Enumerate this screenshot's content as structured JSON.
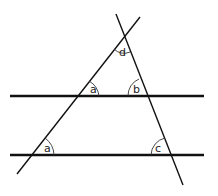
{
  "diagram": {
    "stroke_color": "#111111",
    "parallel_lines": [
      {
        "name": "upper-parallel-line",
        "x1": 10,
        "y1": 96,
        "x2": 204,
        "y2": 96
      },
      {
        "name": "lower-parallel-line",
        "x1": 10,
        "y1": 155,
        "x2": 204,
        "y2": 155
      }
    ],
    "transversals": [
      {
        "name": "left-transversal",
        "x1": 17,
        "y1": 174,
        "x2": 140,
        "y2": 17
      },
      {
        "name": "right-transversal",
        "x1": 116,
        "y1": 14,
        "x2": 183,
        "y2": 185
      }
    ],
    "angles": [
      {
        "label": "d",
        "x": 123,
        "y": 56
      },
      {
        "label": "a",
        "x": 93,
        "y": 93
      },
      {
        "label": "b",
        "x": 137,
        "y": 93
      },
      {
        "label": "a",
        "x": 47,
        "y": 152
      },
      {
        "label": "c",
        "x": 159,
        "y": 152
      }
    ]
  }
}
